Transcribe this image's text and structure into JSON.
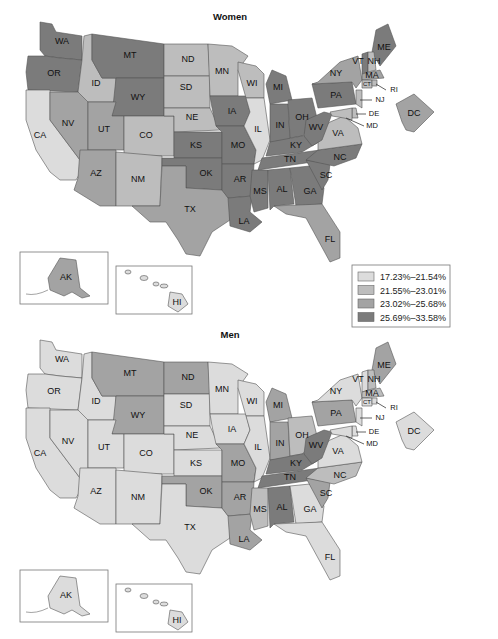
{
  "legend": {
    "items": [
      {
        "label": "17.23%–21.54%",
        "color": "#dcdcdc"
      },
      {
        "label": "21.55%–23.01%",
        "color": "#bdbdbd"
      },
      {
        "label": "23.02%–25.68%",
        "color": "#a3a3a3"
      },
      {
        "label": "25.69%–33.58%",
        "color": "#7b7b7b"
      }
    ]
  },
  "chart_data": [
    {
      "type": "choropleth",
      "title": "Women",
      "legend_placement": "right, between maps",
      "classes": [
        "17.23%–21.54%",
        "21.55%–23.01%",
        "23.02%–25.68%",
        "25.69%–33.58%"
      ],
      "state_class": {
        "WA": 4,
        "OR": 4,
        "CA": 1,
        "ID": 2,
        "NV": 3,
        "MT": 4,
        "WY": 4,
        "UT": 3,
        "CO": 2,
        "AZ": 3,
        "NM": 2,
        "ND": 2,
        "SD": 2,
        "NE": 2,
        "KS": 4,
        "OK": 4,
        "TX": 3,
        "MN": 2,
        "IA": 4,
        "MO": 4,
        "AR": 4,
        "LA": 4,
        "WI": 2,
        "IL": 1,
        "MI": 4,
        "IN": 4,
        "OH": 4,
        "KY": 4,
        "TN": 4,
        "MS": 4,
        "AL": 4,
        "GA": 4,
        "FL": 3,
        "SC": 4,
        "NC": 4,
        "VA": 2,
        "WV": 4,
        "PA": 4,
        "NY": 3,
        "ME": 4,
        "VT": 4,
        "NH": 2,
        "MA": 3,
        "CT": 2,
        "RI": 2,
        "NJ": 2,
        "DE": 2,
        "MD": 2,
        "DC": 3,
        "AK": 3,
        "HI": 1
      }
    },
    {
      "type": "choropleth",
      "title": "Men",
      "classes": [
        "17.23%–21.54%",
        "21.55%–23.01%",
        "23.02%–25.68%",
        "25.69%–33.58%"
      ],
      "state_class": {
        "WA": 1,
        "OR": 1,
        "CA": 1,
        "ID": 1,
        "NV": 1,
        "MT": 3,
        "WY": 3,
        "UT": 1,
        "CO": 1,
        "AZ": 1,
        "NM": 1,
        "ND": 3,
        "SD": 1,
        "NE": 1,
        "KS": 1,
        "OK": 3,
        "TX": 1,
        "MN": 1,
        "IA": 1,
        "MO": 3,
        "AR": 3,
        "LA": 3,
        "WI": 1,
        "IL": 1,
        "MI": 3,
        "IN": 3,
        "OH": 2,
        "KY": 4,
        "TN": 4,
        "MS": 2,
        "AL": 4,
        "GA": 1,
        "FL": 1,
        "SC": 3,
        "NC": 2,
        "VA": 1,
        "WV": 4,
        "PA": 3,
        "NY": 1,
        "ME": 3,
        "VT": 1,
        "NH": 2,
        "MA": 2,
        "CT": 1,
        "RI": 1,
        "NJ": 1,
        "DE": 1,
        "MD": 1,
        "DC": 1,
        "AK": 1,
        "HI": 1
      }
    }
  ]
}
